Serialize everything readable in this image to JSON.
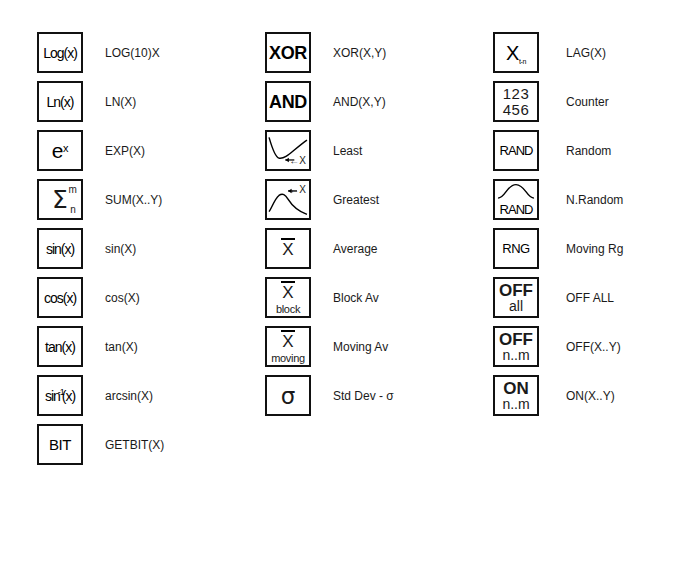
{
  "sheet": {
    "title": "Function Palette Icon Reference",
    "background_color": "#ffffff",
    "ink_color": "#111111"
  },
  "columns": [
    {
      "name": "column-1",
      "rows": [
        {
          "icon": "log-icon",
          "glyph": "Log(x)",
          "glyph_kind": "text",
          "label": "LOG(10)X"
        },
        {
          "icon": "ln-icon",
          "glyph": "Ln(x)",
          "glyph_kind": "text",
          "label": "LN(X)"
        },
        {
          "icon": "exp-icon",
          "glyph": "e",
          "glyph_sup": "x",
          "glyph_kind": "exponent",
          "label": "EXP(X)"
        },
        {
          "icon": "sum-icon",
          "glyph": "Σ",
          "glyph_sup": "m",
          "glyph_sub": "n",
          "glyph_kind": "sigma",
          "label": "SUM(X..Y)"
        },
        {
          "icon": "sin-icon",
          "glyph": "sin(x)",
          "glyph_kind": "text",
          "label": "sin(X)"
        },
        {
          "icon": "cos-icon",
          "glyph": "cos(x)",
          "glyph_kind": "text",
          "label": "cos(X)"
        },
        {
          "icon": "tan-icon",
          "glyph": "tan(x)",
          "glyph_kind": "text",
          "label": "tan(X)"
        },
        {
          "icon": "arcsin-icon",
          "glyph": "sin",
          "glyph_sup": "-1",
          "glyph_tail": "(x)",
          "glyph_kind": "inverse",
          "label": "arcsin(X)"
        },
        {
          "icon": "getbit-icon",
          "glyph": "BIT",
          "glyph_kind": "text",
          "label": "GETBIT(X)"
        }
      ]
    },
    {
      "name": "column-2",
      "rows": [
        {
          "icon": "xor-icon",
          "glyph": "XOR",
          "glyph_kind": "text-bold",
          "label": "XOR(X,Y)"
        },
        {
          "icon": "and-icon",
          "glyph": "AND",
          "glyph_kind": "text-bold",
          "label": "AND(X,Y)"
        },
        {
          "icon": "least-icon",
          "glyph": "←X",
          "glyph_kind": "curve-valley",
          "label": "Least"
        },
        {
          "icon": "greatest-icon",
          "glyph": "←X",
          "glyph_kind": "curve-peak",
          "label": "Greatest"
        },
        {
          "icon": "average-icon",
          "glyph": "X",
          "glyph_kind": "x-bar",
          "label": "Average"
        },
        {
          "icon": "block-average-icon",
          "glyph": "X",
          "glyph_sub_word": "block",
          "glyph_kind": "x-bar-stack",
          "label": "Block Av"
        },
        {
          "icon": "moving-average-icon",
          "glyph": "X",
          "glyph_sub_word": "moving",
          "glyph_kind": "x-bar-stack",
          "label": "Moving Av"
        },
        {
          "icon": "std-dev-icon",
          "glyph": "σ",
          "glyph_kind": "stddev",
          "label": "Std Dev - σ"
        }
      ]
    },
    {
      "name": "column-3",
      "rows": [
        {
          "icon": "lag-icon",
          "glyph": "X",
          "glyph_sub": "t-n",
          "glyph_kind": "lag",
          "label": "LAG(X)"
        },
        {
          "icon": "counter-icon",
          "glyph": "123",
          "glyph_line2": "456",
          "glyph_kind": "counter",
          "label": "Counter"
        },
        {
          "icon": "random-icon",
          "glyph": "RAND",
          "glyph_kind": "text",
          "label": "Random"
        },
        {
          "icon": "normal-random-icon",
          "glyph": "RAND",
          "glyph_kind": "bell-curve",
          "label": "N.Random"
        },
        {
          "icon": "moving-range-icon",
          "glyph": "RNG",
          "glyph_kind": "text",
          "label": "Moving Rg"
        },
        {
          "icon": "off-all-icon",
          "glyph": "OFF",
          "glyph_line2": "all",
          "glyph_kind": "two-line",
          "label": "OFF ALL"
        },
        {
          "icon": "off-range-icon",
          "glyph": "OFF",
          "glyph_line2": "n..m",
          "glyph_kind": "two-line",
          "label": "OFF(X..Y)"
        },
        {
          "icon": "on-range-icon",
          "glyph": "ON",
          "glyph_line2": "n..m",
          "glyph_kind": "two-line",
          "label": "ON(X..Y)"
        }
      ]
    }
  ]
}
